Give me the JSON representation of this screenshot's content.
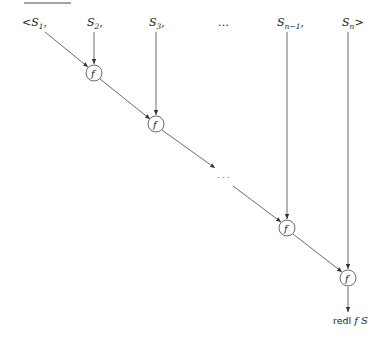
{
  "diagram": {
    "title_rule": true,
    "inputs": [
      {
        "prefix": "<",
        "base": "S",
        "sub": "1",
        "suffix": ","
      },
      {
        "prefix": "",
        "base": "S",
        "sub": "2",
        "suffix": ","
      },
      {
        "prefix": "",
        "base": "S",
        "sub": "3",
        "suffix": ","
      },
      {
        "prefix": "",
        "base": "…",
        "sub": "",
        "suffix": ""
      },
      {
        "prefix": "",
        "base": "S",
        "sub": "n−1",
        "suffix": ","
      },
      {
        "prefix": "",
        "base": "S",
        "sub": "n",
        "suffix": ">"
      }
    ],
    "nodes": [
      {
        "label": "f"
      },
      {
        "label": "f"
      },
      {
        "label": "f"
      },
      {
        "label": "f"
      }
    ],
    "middle_ellipsis": "· · ·",
    "result": {
      "prefix": "redl ",
      "func": "f",
      "arg": " S"
    }
  }
}
